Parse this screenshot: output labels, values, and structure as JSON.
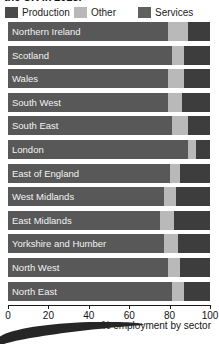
{
  "title": "the UK in 2015.",
  "legend": {
    "position": "top",
    "items": [
      {
        "label": "Production",
        "color": "#4a4a4a",
        "name": "legend-production"
      },
      {
        "label": "Other",
        "color": "#b8b8b8",
        "name": "legend-other"
      },
      {
        "label": "Services",
        "color": "#606060",
        "name": "legend-services"
      }
    ]
  },
  "axis": {
    "ticks": [
      "0",
      "20",
      "40",
      "60",
      "80",
      "100"
    ],
    "xlabel": "% employment by sector"
  },
  "colors": {
    "services": "#585858",
    "other": "#b9b9b9",
    "production": "#3d3d3d",
    "background": "#ffffff",
    "text": "#141414",
    "bar_text": "#f2f2f2"
  },
  "chart_data": {
    "type": "bar",
    "orientation": "horizontal",
    "stacked": true,
    "title": "the UK in 2015.",
    "xlabel": "% employment by sector",
    "ylabel": "",
    "xlim": [
      0,
      100
    ],
    "xticks": [
      0,
      20,
      40,
      60,
      80,
      100
    ],
    "grid": false,
    "legend_position": "top",
    "categories": [
      "Northern Ireland",
      "Scotland",
      "Wales",
      "South West",
      "South East",
      "London",
      "East of England",
      "West Midlands",
      "East Midlands",
      "Yorkshire and Humber",
      "North West",
      "North East"
    ],
    "series": [
      {
        "name": "Services",
        "color": "#585858",
        "values": [
          79,
          81,
          79,
          79,
          81,
          89,
          80,
          77,
          75,
          77,
          79,
          81
        ]
      },
      {
        "name": "Other",
        "color": "#b9b9b9",
        "values": [
          10,
          6,
          8,
          7,
          8,
          4,
          5,
          6,
          7,
          7,
          6,
          6
        ]
      },
      {
        "name": "Production",
        "color": "#3d3d3d",
        "values": [
          11,
          13,
          13,
          14,
          11,
          7,
          15,
          17,
          18,
          16,
          15,
          13
        ]
      }
    ]
  }
}
